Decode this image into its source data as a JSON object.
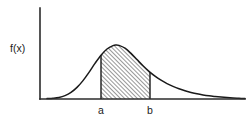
{
  "figure": {
    "background_color": "#ffffff",
    "line_color": "#1a1a1a",
    "axis_color": "#2b2b2b",
    "y_axis_label": "f(x)",
    "x_tick_a": "a",
    "x_tick_b": "b"
  },
  "chart_data": {
    "type": "area",
    "title": "",
    "subtitle": "",
    "xlabel": "",
    "ylabel": "f(x)",
    "grid": false,
    "legend": null,
    "axis_origin_px": [
      40,
      99
    ],
    "x_axis_end_px": [
      245,
      99
    ],
    "y_axis_top_px": [
      40,
      8
    ],
    "xlim": [
      40,
      248
    ],
    "ylim": [
      99,
      8
    ],
    "shaded_interval": {
      "from_label": "a",
      "to_label": "b",
      "from_x_px": 101,
      "to_x_px": 150,
      "fill": "diagonal-hatch",
      "hatch_angle_deg": 45,
      "hatch_spacing_px": 3
    },
    "curve_peak_px": [
      116,
      45
    ],
    "curve_points_px": [
      [
        47,
        98.6
      ],
      [
        53,
        98.2
      ],
      [
        59,
        97.4
      ],
      [
        65,
        95.6
      ],
      [
        71,
        92.4
      ],
      [
        77,
        87.4
      ],
      [
        83,
        80.6
      ],
      [
        89,
        72.4
      ],
      [
        95,
        63.4
      ],
      [
        101,
        55.2
      ],
      [
        107,
        49.0
      ],
      [
        113,
        45.6
      ],
      [
        116,
        45.0
      ],
      [
        119,
        45.4
      ],
      [
        125,
        48.2
      ],
      [
        131,
        53.4
      ],
      [
        137,
        59.6
      ],
      [
        143,
        65.8
      ],
      [
        149,
        71.4
      ],
      [
        155,
        76.2
      ],
      [
        161,
        80.2
      ],
      [
        167,
        83.6
      ],
      [
        173,
        86.4
      ],
      [
        179,
        88.8
      ],
      [
        185,
        90.8
      ],
      [
        191,
        92.4
      ],
      [
        197,
        93.8
      ],
      [
        203,
        94.9
      ],
      [
        209,
        95.8
      ],
      [
        215,
        96.5
      ],
      [
        221,
        97.1
      ],
      [
        227,
        97.6
      ],
      [
        233,
        98.0
      ],
      [
        239,
        98.3
      ],
      [
        245,
        98.6
      ]
    ],
    "x_ticks": [
      {
        "label": "a",
        "x_px": 101
      },
      {
        "label": "b",
        "x_px": 150
      }
    ]
  }
}
